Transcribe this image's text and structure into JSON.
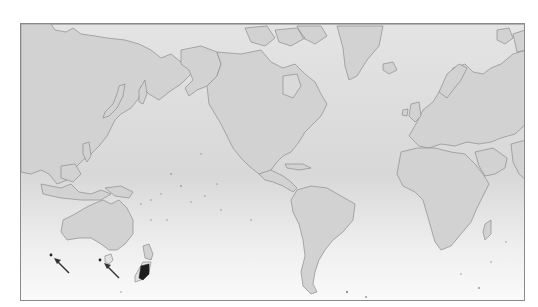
{
  "map": {
    "projection": "Mercator (Pacific-centered)",
    "background_gradient": [
      "#e4e4e4",
      "#fafafa"
    ],
    "land_fill": "#d2d2d2",
    "coast_stroke": "#8c8c8c",
    "highlight_color": "#1e1e1e",
    "highlighted_regions": [
      {
        "name": "South Island, New Zealand",
        "note": "southern portion shaded dark"
      }
    ],
    "markers": [
      {
        "id": "marker-1",
        "location": "off southwest Western Australia",
        "type": "dot-with-arrow"
      },
      {
        "id": "marker-2",
        "location": "Tasmania",
        "type": "dot-with-arrow"
      }
    ],
    "labels": []
  }
}
